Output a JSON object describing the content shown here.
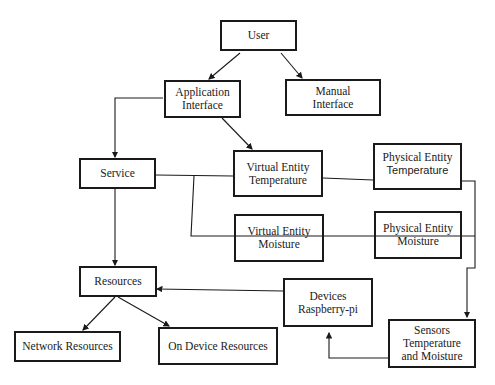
{
  "diagram": {
    "nodes": {
      "user": {
        "lines": [
          "User"
        ]
      },
      "app_interface": {
        "lines": [
          "Application",
          "Interface"
        ]
      },
      "manual_interface": {
        "lines": [
          "Manual",
          "Interface"
        ]
      },
      "service": {
        "lines": [
          "Service"
        ]
      },
      "virtual_temp": {
        "lines": [
          "Virtual Entity",
          "Temperature"
        ]
      },
      "physical_temp": {
        "lines": [
          "Physical Entity",
          "Temperature"
        ]
      },
      "virtual_moist": {
        "lines": [
          "Virtual Entity",
          "Moisture"
        ]
      },
      "physical_moist": {
        "lines": [
          "Physical Entity",
          "Moisture"
        ]
      },
      "resources": {
        "lines": [
          "Resources"
        ]
      },
      "devices": {
        "lines": [
          "Devices",
          "Raspberry-pi"
        ]
      },
      "network_resources": {
        "lines": [
          "Network Resources"
        ]
      },
      "on_device_resources": {
        "lines": [
          "On Device Resources"
        ]
      },
      "sensors": {
        "lines": [
          "Sensors",
          "Temperature",
          "and Moisture"
        ]
      }
    },
    "edges": [
      {
        "from": "User",
        "to": "Application Interface",
        "arrow": true
      },
      {
        "from": "User",
        "to": "Manual Interface",
        "arrow": true
      },
      {
        "from": "Application Interface",
        "to": "Service",
        "arrow": true
      },
      {
        "from": "Application Interface",
        "to": "Virtual Entity Temperature",
        "arrow": true
      },
      {
        "from": "Service",
        "to": "Virtual Entity Temperature",
        "arrow": false
      },
      {
        "from": "Service",
        "to": "Virtual Entity Moisture",
        "arrow": false
      },
      {
        "from": "Virtual Entity Temperature",
        "to": "Physical Entity Temperature",
        "arrow": false
      },
      {
        "from": "Virtual Entity Moisture",
        "to": "Physical Entity Moisture",
        "arrow": false
      },
      {
        "from": "Physical Entity Temperature",
        "to": "Sensors Temperature and Moisture",
        "arrow": true
      },
      {
        "from": "Service",
        "to": "Resources",
        "arrow": true
      },
      {
        "from": "Devices Raspberry-pi",
        "to": "Resources",
        "arrow": true
      },
      {
        "from": "Resources",
        "to": "Network Resources",
        "arrow": true
      },
      {
        "from": "Resources",
        "to": "On Device Resources",
        "arrow": true
      },
      {
        "from": "Sensors Temperature and Moisture",
        "to": "Devices Raspberry-pi",
        "arrow": true
      }
    ]
  }
}
